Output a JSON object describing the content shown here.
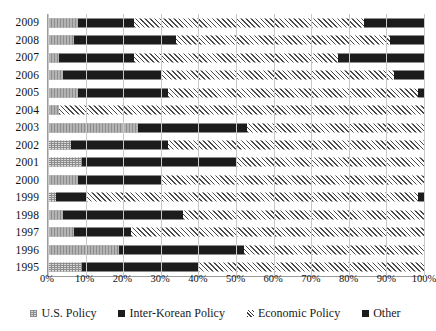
{
  "chart_data": {
    "type": "bar",
    "subtype": "stacked-horizontal-100-percent",
    "title": "",
    "xlabel": "",
    "ylabel": "",
    "xlim": [
      0,
      100
    ],
    "xticks": [
      "0%",
      "10%",
      "20%",
      "30%",
      "40%",
      "50%",
      "60%",
      "70%",
      "80%",
      "90%",
      "100%"
    ],
    "xtick_values": [
      0,
      10,
      20,
      30,
      40,
      50,
      60,
      70,
      80,
      90,
      100
    ],
    "grid": true,
    "grid_axis": "x",
    "legend_position": "bottom",
    "categories": [
      "2009",
      "2008",
      "2007",
      "2006",
      "2005",
      "2004",
      "2003",
      "2002",
      "2001",
      "2000",
      "1999",
      "1998",
      "1997",
      "1996",
      "1995"
    ],
    "series": [
      {
        "name": "U.S. Policy",
        "key": "us",
        "color": "#d9d9d9",
        "pattern": "dotted",
        "values": [
          8,
          7,
          3,
          4,
          8,
          3,
          24,
          6,
          9,
          8,
          2,
          4,
          7,
          19,
          9
        ]
      },
      {
        "name": "Inter-Korean Policy",
        "key": "inter_korean",
        "color": "#1c1c1c",
        "pattern": "solid",
        "values": [
          15,
          27,
          20,
          26,
          24,
          0,
          29,
          26,
          41,
          22,
          8,
          32,
          15,
          33,
          31
        ]
      },
      {
        "name": "Economic Policy",
        "key": "economic",
        "color": "#ffffff",
        "pattern": "diagonal-hatch",
        "values": [
          61,
          57,
          54,
          62,
          66.5,
          97,
          47,
          68,
          50,
          70,
          88.5,
          64,
          78,
          48,
          60
        ]
      },
      {
        "name": "Other",
        "key": "other",
        "color": "#1c1c1c",
        "pattern": "solid",
        "values": [
          16,
          9,
          23,
          8,
          1.5,
          0,
          0,
          0,
          0,
          0,
          1.5,
          0,
          0,
          0,
          0
        ]
      }
    ],
    "cumulative_boundaries": {
      "2009": [
        8,
        23,
        84,
        100
      ],
      "2008": [
        7,
        34,
        91,
        100
      ],
      "2007": [
        3,
        23,
        77,
        100
      ],
      "2006": [
        4,
        30,
        92,
        100
      ],
      "2005": [
        8,
        32,
        98.5,
        100
      ],
      "2004": [
        3,
        3,
        100,
        100
      ],
      "2003": [
        24,
        53,
        100,
        100
      ],
      "2002": [
        6,
        32,
        100,
        100
      ],
      "2001": [
        9,
        50,
        100,
        100
      ],
      "2000": [
        8,
        30,
        100,
        100
      ],
      "1999": [
        2,
        10,
        98.5,
        100
      ],
      "1998": [
        4,
        36,
        100,
        100
      ],
      "1997": [
        7,
        22,
        100,
        100
      ],
      "1996": [
        19,
        52,
        100,
        100
      ],
      "1995": [
        9,
        40,
        100,
        100
      ]
    }
  },
  "legend": {
    "items": [
      {
        "label": "U.S. Policy",
        "key": "us"
      },
      {
        "label": "Inter-Korean Policy",
        "key": "inter_korean"
      },
      {
        "label": "Economic Policy",
        "key": "economic"
      },
      {
        "label": "Other",
        "key": "other"
      }
    ]
  }
}
